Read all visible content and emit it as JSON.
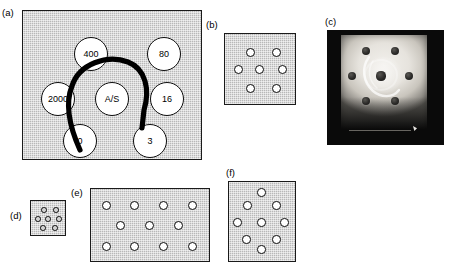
{
  "figure": {
    "caption_labels": {
      "a": "(a)",
      "b": "(b)",
      "c": "(c)",
      "d": "(d)",
      "e": "(e)",
      "f": "(f)"
    },
    "colors": {
      "gel_fill": "#b8b8b8",
      "gel_border": "#1a1a1a",
      "well_fill": "#ffffff",
      "well_border": "#0d0d0d",
      "arc_line": "#000000",
      "photo_background": "#0a0a0a",
      "photo_gel": "#efece6",
      "page_background": "#ffffff"
    }
  },
  "panels": {
    "a": {
      "label": "(a)",
      "type": "schematic-diagram",
      "description": "Hatched gel square with seven labelled wells in a hexagonal rosette and one central well, crossed by a thick curved precipitin line",
      "well_count": 7,
      "wells": [
        {
          "id": "well-400",
          "label": "400",
          "x": 52,
          "y": 27,
          "position": "upper-left"
        },
        {
          "id": "well-80",
          "label": "80",
          "x": 125,
          "y": 27,
          "position": "upper-right"
        },
        {
          "id": "well-2000",
          "label": "2000",
          "x": 19,
          "y": 72,
          "position": "left"
        },
        {
          "id": "well-as",
          "label": "A/S",
          "x": 73,
          "y": 72,
          "position": "center"
        },
        {
          "id": "well-16",
          "label": "16",
          "x": 128,
          "y": 72,
          "position": "right"
        },
        {
          "id": "well-0",
          "label": "0",
          "x": 41,
          "y": 114,
          "position": "lower-left"
        },
        {
          "id": "well-3",
          "label": "3",
          "x": 111,
          "y": 114,
          "position": "lower-right"
        }
      ],
      "arc": {
        "name": "precipitin-arc",
        "path": "M 58 140 C 49 120, 42 96, 50 76 C 57 54, 85 44, 106 52 C 124 59, 128 80, 122 100 L 120 118",
        "stroke_width": 5.2
      }
    },
    "b": {
      "label": "(b)",
      "type": "schematic-diagram",
      "description": "Small hatched gel square with seven unlabelled wells in a hexagonal rosette",
      "well_count": 7,
      "wells": [
        {
          "id": "b-well-1",
          "x": 22,
          "y": 15,
          "position": "upper-left"
        },
        {
          "id": "b-well-2",
          "x": 48,
          "y": 15,
          "position": "upper-right"
        },
        {
          "id": "b-well-3",
          "x": 10,
          "y": 32,
          "position": "left"
        },
        {
          "id": "b-well-4",
          "x": 31,
          "y": 32,
          "position": "center"
        },
        {
          "id": "b-well-5",
          "x": 54,
          "y": 32,
          "position": "right"
        },
        {
          "id": "b-well-6",
          "x": 22,
          "y": 51,
          "position": "lower-left"
        },
        {
          "id": "b-well-7",
          "x": 48,
          "y": 51,
          "position": "lower-right"
        }
      ]
    },
    "c": {
      "label": "(c)",
      "type": "photograph",
      "description": "Photograph of a real immunodiffusion gel plate on a dark background showing seven dark wells and a faint white precipitin band near the central well",
      "well_count": 7,
      "wells": [
        {
          "id": "c-well-1",
          "x": 25,
          "y": 16,
          "r": 4.4,
          "position": "upper-left"
        },
        {
          "id": "c-well-2",
          "x": 54,
          "y": 16,
          "r": 4.4,
          "position": "upper-right"
        },
        {
          "id": "c-well-3",
          "x": 11,
          "y": 41,
          "r": 4.2,
          "position": "left"
        },
        {
          "id": "c-well-4",
          "x": 40,
          "y": 41,
          "r": 4.6,
          "position": "center"
        },
        {
          "id": "c-well-5",
          "x": 68,
          "y": 41,
          "r": 4.2,
          "position": "right"
        },
        {
          "id": "c-well-6",
          "x": 25,
          "y": 66,
          "r": 4.4,
          "position": "lower-left"
        },
        {
          "id": "c-well-7",
          "x": 54,
          "y": 66,
          "r": 4.4,
          "position": "lower-right"
        }
      ]
    },
    "d": {
      "label": "(d)",
      "type": "schematic-diagram",
      "description": "Very small hatched gel square with seven tiny wells in a hexagonal rosette",
      "well_count": 7,
      "wells": [
        {
          "id": "d-well-1",
          "x": 11,
          "y": 7,
          "position": "upper-left"
        },
        {
          "id": "d-well-2",
          "x": 23,
          "y": 7,
          "position": "upper-right"
        },
        {
          "id": "d-well-3",
          "x": 5,
          "y": 16,
          "position": "left"
        },
        {
          "id": "d-well-4",
          "x": 15,
          "y": 16,
          "position": "center"
        },
        {
          "id": "d-well-5",
          "x": 26,
          "y": 16,
          "position": "right"
        },
        {
          "id": "d-well-6",
          "x": 10,
          "y": 25,
          "position": "lower-left"
        },
        {
          "id": "d-well-7",
          "x": 22,
          "y": 25,
          "position": "lower-right"
        }
      ]
    },
    "e": {
      "label": "(e)",
      "type": "schematic-diagram",
      "description": "Wide hatched gel rectangle with eleven wells arranged in three rows of four, three and four",
      "well_count": 11,
      "wells": [
        {
          "id": "e-well-1",
          "x": 12,
          "y": 13,
          "position": "top-row-1"
        },
        {
          "id": "e-well-2",
          "x": 40,
          "y": 13,
          "position": "top-row-2"
        },
        {
          "id": "e-well-3",
          "x": 69,
          "y": 13,
          "position": "top-row-3"
        },
        {
          "id": "e-well-4",
          "x": 98,
          "y": 13,
          "position": "top-row-4"
        },
        {
          "id": "e-well-5",
          "x": 26,
          "y": 33,
          "position": "middle-row-1"
        },
        {
          "id": "e-well-6",
          "x": 55,
          "y": 33,
          "position": "middle-row-2"
        },
        {
          "id": "e-well-7",
          "x": 84,
          "y": 33,
          "position": "middle-row-3"
        },
        {
          "id": "e-well-8",
          "x": 12,
          "y": 54,
          "position": "bottom-row-1"
        },
        {
          "id": "e-well-9",
          "x": 40,
          "y": 54,
          "position": "bottom-row-2"
        },
        {
          "id": "e-well-10",
          "x": 69,
          "y": 54,
          "position": "bottom-row-3"
        },
        {
          "id": "e-well-11",
          "x": 98,
          "y": 54,
          "position": "bottom-row-4"
        }
      ]
    },
    "f": {
      "label": "(f)",
      "type": "schematic-diagram",
      "description": "Hatched gel square with ten wells in a staggered rosette pattern of two, three, three and two",
      "well_count": 10,
      "wells": [
        {
          "id": "f-well-1",
          "x": 29,
          "y": 7,
          "position": "top-center"
        },
        {
          "id": "f-well-2",
          "x": 15,
          "y": 20,
          "position": "upper-left"
        },
        {
          "id": "f-well-3",
          "x": 44,
          "y": 20,
          "position": "upper-right"
        },
        {
          "id": "f-well-4",
          "x": 5,
          "y": 37,
          "position": "middle-left"
        },
        {
          "id": "f-well-5",
          "x": 29,
          "y": 37,
          "position": "middle-center"
        },
        {
          "id": "f-well-6",
          "x": 52,
          "y": 37,
          "position": "middle-right"
        },
        {
          "id": "f-well-7",
          "x": 14,
          "y": 54,
          "position": "lower-left"
        },
        {
          "id": "f-well-8",
          "x": 44,
          "y": 54,
          "position": "lower-right"
        },
        {
          "id": "f-well-9",
          "x": 29,
          "y": 64,
          "position": "bottom-center"
        },
        {
          "id": "f-well-10",
          "x": 29,
          "y": 64,
          "position": "bottom-center-duplicate"
        }
      ]
    }
  }
}
